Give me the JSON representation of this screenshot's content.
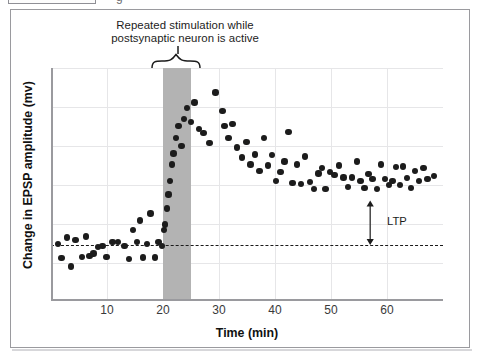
{
  "figure": {
    "caption_line1": "Repeated stimulation while",
    "caption_line2": "postsynaptic neuron is active",
    "ltp_label": "LTP"
  },
  "chart_data": {
    "type": "scatter",
    "title": "",
    "subtitle": "",
    "xlabel": "Time (min)",
    "ylabel": "Change in EPSP amplitude (mv)",
    "xlim": [
      0,
      70
    ],
    "ylim": [
      -1.4,
      4.5
    ],
    "xticks": [
      10,
      20,
      30,
      40,
      50,
      60
    ],
    "xticklabels": [
      "10",
      "20",
      "30",
      "40",
      "50",
      "60"
    ],
    "yticks": [],
    "yticklabels": [],
    "grid": "both",
    "legend": "none",
    "baseline_y": 0,
    "baseline_style": "dashed",
    "shaded_region": {
      "label": "Repeated stimulation while postsynaptic neuron is active",
      "x_start": 20,
      "x_end": 25,
      "color": "#b3b3b3"
    },
    "annotations": [
      {
        "text": "LTP",
        "type": "double-arrow",
        "x": 57,
        "y_start": 0,
        "y_end": 1.13,
        "label_x": 60,
        "label_y": 0.58
      }
    ],
    "series": [
      {
        "name": "EPSP amplitude",
        "color": "#1c1c1c",
        "marker": "circle",
        "points": [
          [
            1.2,
            0.02
          ],
          [
            1.9,
            -0.33
          ],
          [
            2.9,
            0.19
          ],
          [
            3.6,
            -0.55
          ],
          [
            4.4,
            0.12
          ],
          [
            5.5,
            -0.3
          ],
          [
            6.2,
            0.22
          ],
          [
            6.9,
            -0.28
          ],
          [
            7.6,
            -0.22
          ],
          [
            8.4,
            -0.05
          ],
          [
            9.2,
            -0.02
          ],
          [
            9.9,
            -0.3
          ],
          [
            11.0,
            0.07
          ],
          [
            12.0,
            0.08
          ],
          [
            13.1,
            -0.02
          ],
          [
            13.9,
            -0.35
          ],
          [
            14.6,
            0.38
          ],
          [
            15.4,
            0.08
          ],
          [
            15.9,
            0.62
          ],
          [
            16.4,
            -0.32
          ],
          [
            17.1,
            0.02
          ],
          [
            17.8,
            0.8
          ],
          [
            18.6,
            -0.32
          ],
          [
            19.2,
            0.08
          ],
          [
            19.8,
            -0.02
          ],
          [
            20.2,
            0.38
          ],
          [
            20.4,
            0.52
          ],
          [
            20.7,
            0.93
          ],
          [
            21.0,
            1.28
          ],
          [
            21.3,
            1.62
          ],
          [
            21.6,
            2.05
          ],
          [
            21.9,
            2.33
          ],
          [
            22.3,
            2.72
          ],
          [
            22.8,
            3.02
          ],
          [
            23.3,
            2.52
          ],
          [
            23.8,
            3.2
          ],
          [
            24.3,
            3.48
          ],
          [
            25.0,
            3.12
          ],
          [
            25.6,
            3.62
          ],
          [
            26.4,
            2.95
          ],
          [
            27.2,
            2.85
          ],
          [
            28.3,
            2.6
          ],
          [
            29.4,
            3.88
          ],
          [
            30.6,
            3.4
          ],
          [
            31.0,
            3.02
          ],
          [
            31.7,
            2.72
          ],
          [
            32.4,
            3.08
          ],
          [
            33.2,
            2.48
          ],
          [
            34.1,
            2.22
          ],
          [
            34.9,
            2.62
          ],
          [
            35.6,
            2.05
          ],
          [
            36.4,
            2.3
          ],
          [
            37.2,
            1.88
          ],
          [
            38.0,
            2.72
          ],
          [
            38.7,
            2.02
          ],
          [
            39.5,
            2.28
          ],
          [
            40.2,
            1.62
          ],
          [
            41.0,
            1.85
          ],
          [
            41.7,
            2.12
          ],
          [
            42.4,
            2.88
          ],
          [
            43.1,
            1.58
          ],
          [
            43.9,
            2.05
          ],
          [
            44.6,
            1.55
          ],
          [
            45.4,
            2.25
          ],
          [
            46.2,
            1.6
          ],
          [
            47.0,
            1.42
          ],
          [
            47.8,
            1.82
          ],
          [
            48.4,
            1.95
          ],
          [
            49.0,
            1.42
          ],
          [
            49.8,
            1.85
          ],
          [
            50.6,
            1.78
          ],
          [
            51.4,
            2.02
          ],
          [
            52.2,
            1.72
          ],
          [
            53.0,
            1.48
          ],
          [
            53.8,
            1.72
          ],
          [
            54.6,
            2.12
          ],
          [
            55.3,
            1.62
          ],
          [
            56.0,
            1.45
          ],
          [
            56.7,
            1.8
          ],
          [
            57.4,
            1.68
          ],
          [
            58.2,
            1.42
          ],
          [
            58.9,
            2.05
          ],
          [
            59.6,
            1.68
          ],
          [
            60.4,
            1.52
          ],
          [
            61.0,
            1.62
          ],
          [
            61.6,
            1.98
          ],
          [
            62.3,
            1.52
          ],
          [
            62.9,
            2.0
          ],
          [
            63.6,
            1.7
          ],
          [
            64.3,
            1.45
          ],
          [
            65.0,
            1.88
          ],
          [
            65.7,
            1.62
          ],
          [
            66.5,
            1.95
          ],
          [
            67.2,
            1.68
          ],
          [
            68.4,
            1.75
          ]
        ]
      }
    ]
  }
}
